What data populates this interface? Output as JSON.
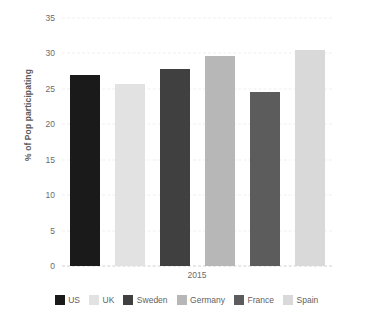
{
  "chart_data": {
    "type": "bar",
    "title": "",
    "subtitle": "",
    "xlabel": "2015",
    "ylabel": "% of Pop participating",
    "categories": [
      "2015"
    ],
    "ylim": [
      0,
      35
    ],
    "yticks": [
      0,
      5,
      10,
      15,
      20,
      25,
      30,
      35
    ],
    "ytick_labels": [
      "0",
      "5",
      "10",
      "15",
      "20",
      "25",
      "30",
      "35"
    ],
    "grid": true,
    "legend_position": "bottom",
    "series": [
      {
        "name": "US",
        "values": [
          26.9
        ],
        "color": "#1a1a1a"
      },
      {
        "name": "UK",
        "values": [
          25.7
        ],
        "color": "#e2e2e2"
      },
      {
        "name": "Sweden",
        "values": [
          27.8
        ],
        "color": "#404040"
      },
      {
        "name": "Germany",
        "values": [
          29.7
        ],
        "color": "#b7b7b7"
      },
      {
        "name": "France",
        "values": [
          24.6
        ],
        "color": "#5c5c5c"
      },
      {
        "name": "Spain",
        "values": [
          30.5
        ],
        "color": "#d9d9d9"
      }
    ]
  },
  "axis": {
    "y_title": "% of Pop participating",
    "x_title": "2015"
  }
}
